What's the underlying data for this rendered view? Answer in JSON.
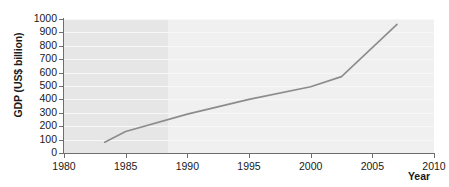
{
  "chart_data": {
    "type": "line",
    "title": "",
    "xlabel": "Year",
    "ylabel": "GDP (US$ billion)",
    "xlim": [
      1980,
      2010
    ],
    "ylim": [
      0,
      1000
    ],
    "xticks": [
      1980,
      1985,
      1990,
      1995,
      2000,
      2005,
      2010
    ],
    "yticks": [
      0,
      100,
      200,
      300,
      400,
      500,
      600,
      700,
      800,
      900,
      1000
    ],
    "grid": "horizontal",
    "legend": "none",
    "line_color": "#8c8c8c",
    "plot_background": "#f0f0f0",
    "shaded_band": {
      "x_start": 1980,
      "x_end": 1988.4,
      "color": "#e6e6e6"
    },
    "series": [
      {
        "name": "GDP",
        "x": [
          1983.3,
          1985,
          1990,
          1995,
          2000,
          2002.5,
          2007
        ],
        "values": [
          80,
          160,
          290,
          400,
          495,
          570,
          960
        ]
      }
    ]
  },
  "axes": {
    "y_title": "GDP (US$ billion)",
    "x_title": "Year",
    "y_tick_labels": [
      "1000",
      "900",
      "800",
      "700",
      "600",
      "500",
      "400",
      "300",
      "200",
      "100",
      "0"
    ],
    "x_tick_labels": [
      "1980",
      "1985",
      "1990",
      "1995",
      "2000",
      "2005",
      "2010"
    ]
  }
}
